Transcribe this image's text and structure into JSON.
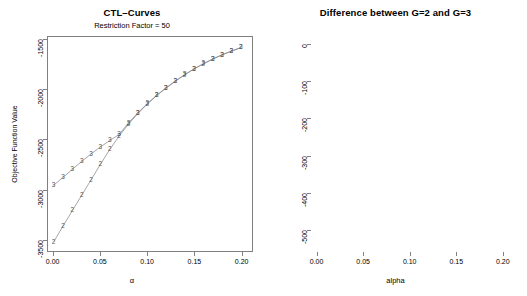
{
  "figure": {
    "width": 527,
    "height": 296,
    "background": "#ffffff",
    "line_color": "#808080",
    "marker_color": "#555555"
  },
  "panels": {
    "left": {
      "title": "CTL–Curves",
      "subtitle": "Restriction Factor = 50",
      "xlabel": "α",
      "ylabel": "Objective Function Value",
      "xticks": [
        "0.00",
        "0.05",
        "0.10",
        "0.15",
        "0.20"
      ],
      "xtick_values": [
        0.0,
        0.05,
        0.1,
        0.15,
        0.2
      ],
      "yticks": [
        "-1500",
        "-2000",
        "-2500",
        "-3000",
        "-3500"
      ],
      "ytick_values": [
        -1500,
        -2000,
        -2500,
        -3000,
        -3500
      ]
    },
    "right": {
      "title": "Difference between G=2 and G=3",
      "xlabel": "alpha",
      "ylabel": "",
      "xticks": [
        "0.00",
        "0.05",
        "0.10",
        "0.15",
        "0.20"
      ],
      "xtick_values": [
        0.0,
        0.05,
        0.1,
        0.15,
        0.2
      ],
      "yticks": [
        "0",
        "-100",
        "-200",
        "-300",
        "-400",
        "-500"
      ],
      "ytick_values": [
        0,
        -100,
        -200,
        -300,
        -400,
        -500
      ]
    }
  },
  "chart_data": [
    {
      "type": "line",
      "title": "CTL–Curves",
      "subtitle": "Restriction Factor = 50",
      "xlabel": "α",
      "ylabel": "Objective Function Value",
      "xlim": [
        -0.006,
        0.212
      ],
      "ylim": [
        -3620,
        -1470
      ],
      "grid": false,
      "legend": "none",
      "marker_style": "group-number-glyph",
      "x": [
        0.0,
        0.01,
        0.02,
        0.03,
        0.04,
        0.05,
        0.06,
        0.07,
        0.08,
        0.09,
        0.1,
        0.11,
        0.12,
        0.13,
        0.14,
        0.15,
        0.16,
        0.17,
        0.18,
        0.19,
        0.2
      ],
      "series": [
        {
          "name": "G=2",
          "marker_label": "2",
          "values": [
            -3530,
            -3370,
            -3215,
            -3060,
            -2905,
            -2750,
            -2600,
            -2465,
            -2345,
            -2240,
            -2145,
            -2060,
            -1985,
            -1915,
            -1850,
            -1792,
            -1740,
            -1692,
            -1650,
            -1612,
            -1578
          ]
        },
        {
          "name": "G=3",
          "marker_label": "3",
          "values": [
            -2960,
            -2880,
            -2800,
            -2720,
            -2645,
            -2575,
            -2510,
            -2450,
            -2333,
            -2232,
            -2140,
            -2056,
            -1982,
            -1913,
            -1849,
            -1791,
            -1739,
            -1691,
            -1649,
            -1611,
            -1577
          ]
        }
      ]
    },
    {
      "type": "line",
      "title": "Difference between G=2 and G=3",
      "xlabel": "alpha",
      "ylabel": "",
      "xlim": [
        -0.006,
        0.212
      ],
      "ylim": [
        -560,
        22
      ],
      "grid": false,
      "legend": "none",
      "marker_style": "open-circle",
      "reference_line": {
        "y": 0,
        "style": "dotted"
      },
      "x": [
        0.0,
        0.01,
        0.02,
        0.03,
        0.04,
        0.05,
        0.06,
        0.07,
        0.08,
        0.09,
        0.1,
        0.11,
        0.12,
        0.13,
        0.14,
        0.15,
        0.16,
        0.17,
        0.18,
        0.19,
        0.2
      ],
      "values": [
        -532,
        -415,
        -318,
        -233,
        -162,
        -104,
        -60,
        -23,
        -12,
        -8,
        -6,
        -5,
        -4,
        -4,
        -3,
        -3,
        -2,
        -2,
        -2,
        -2,
        -1
      ]
    }
  ]
}
